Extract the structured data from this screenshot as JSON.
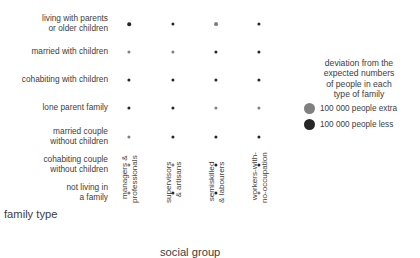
{
  "chart_data": {
    "type": "heatmap",
    "title": "",
    "subtitle": "",
    "xlabel": "social group",
    "ylabel": "family type",
    "grid": false,
    "legend_position": "right",
    "value_unit": "people",
    "legend_title": "deviation from the\nexpected numbers\nof people in each\ntype of family",
    "legend_entries": [
      {
        "label": "100 000 people extra",
        "color": "#808080",
        "sign": "extra",
        "reference_value": 100000
      },
      {
        "label": "100 000 people less",
        "color": "#262626",
        "sign": "less",
        "reference_value": 100000
      }
    ],
    "categories": [
      "managers & professionals",
      "supervisors & artisans",
      "semiskilled & labourers",
      "workers-with-no-occupation"
    ],
    "rows": [
      "living with parents or older children",
      "married with children",
      "cohabiting with children",
      "lone parent family",
      "married couple without children",
      "cohabiting couple without children",
      "not living in a family"
    ],
    "series": [
      {
        "name": "living with parents or older children",
        "values": [
          -530000,
          -75000,
          620000,
          -9000
        ]
      },
      {
        "name": "married with children",
        "values": [
          300000,
          145000,
          -420000,
          -50000
        ]
      },
      {
        "name": "cohabiting with children",
        "values": [
          -18000,
          -10000,
          -7000,
          -5000
        ]
      },
      {
        "name": "lone parent family",
        "values": [
          -63000,
          -60000,
          95000,
          18000
        ]
      },
      {
        "name": "married couple without children",
        "values": [
          290000,
          -13000,
          -33000,
          -160000
        ]
      },
      {
        "name": "cohabiting couple without children",
        "values": [
          25000,
          6000,
          -25000,
          -30000
        ]
      },
      {
        "name": "not living in a family",
        "values": [
          40000,
          -48000,
          -400000,
          340000
        ]
      }
    ]
  },
  "rows": [
    {
      "label": "living with parents\nor older children"
    },
    {
      "label": "married with children"
    },
    {
      "label": "cohabiting with children"
    },
    {
      "label": "lone parent family"
    },
    {
      "label": "married couple\nwithout children"
    },
    {
      "label": "cohabiting couple\nwithout children"
    },
    {
      "label": "not living in\na family"
    }
  ],
  "columns": [
    {
      "label": "managers &\nprofessionals"
    },
    {
      "label": "supervisors\n& artisans"
    },
    {
      "label": "semiskilled\n& labourers"
    },
    {
      "label": "workers-with-\nno-occupation"
    }
  ],
  "axes": {
    "family_type": "family type",
    "social_group": "social group"
  },
  "legend": {
    "title": "deviation from the\nexpected numbers\nof people in each\ntype of family",
    "entries": [
      {
        "label": "100 000 people extra",
        "color": "#808080"
      },
      {
        "label": "100 000 people less",
        "color": "#262626"
      }
    ]
  },
  "layout": {
    "column_x": [
      129,
      172.5,
      216,
      259
    ],
    "row_y": [
      24,
      52,
      80,
      108,
      137,
      165,
      193
    ],
    "row_label_y": [
      14,
      47,
      75,
      103,
      127,
      155,
      183
    ],
    "column_label_y": 203,
    "radius_scale": 2.45e-05,
    "min_radius": 1.6
  },
  "colors": {
    "extra": "#808080",
    "less": "#262626",
    "text": "#3d3d3d",
    "background": "#ffffff"
  }
}
